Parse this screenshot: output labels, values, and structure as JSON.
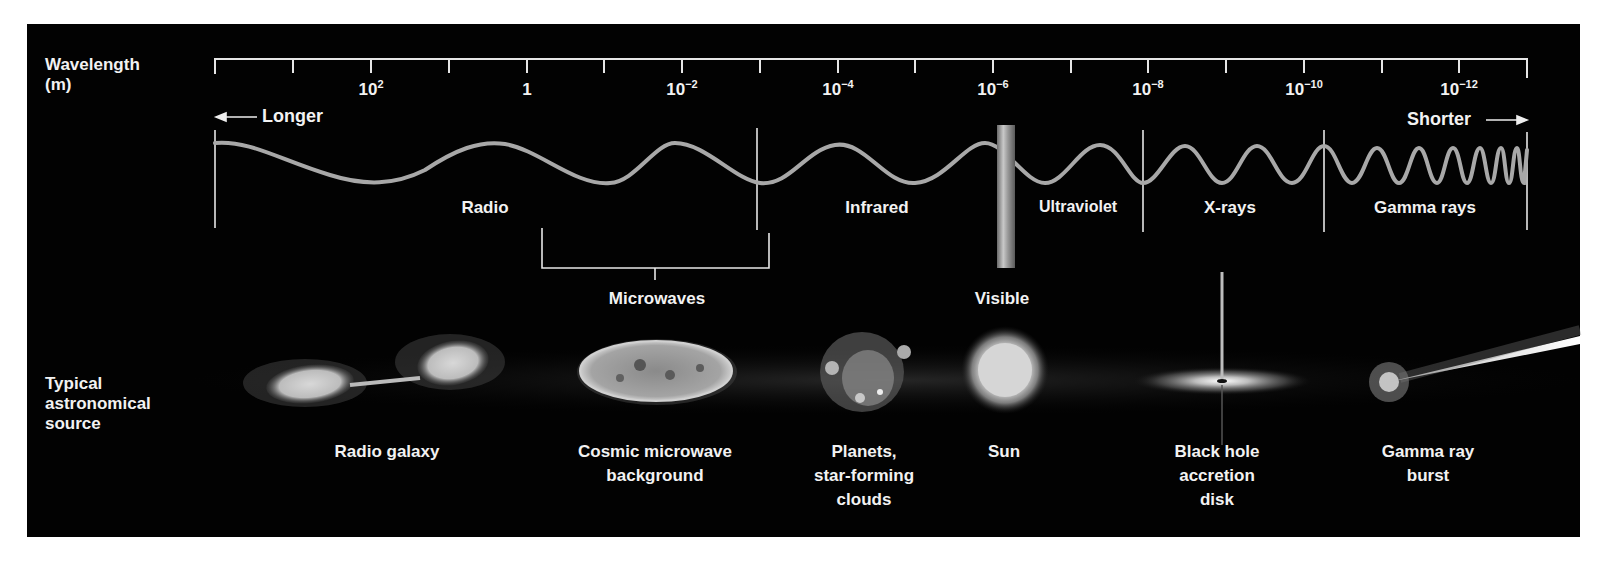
{
  "axis": {
    "title_line1": "Wavelength",
    "title_line2": "(m)",
    "ticks": [
      {
        "base": "10",
        "exp": "2",
        "x": 371
      },
      {
        "base": "1",
        "exp": "",
        "x": 527
      },
      {
        "base": "10",
        "exp": "−2",
        "x": 682
      },
      {
        "base": "10",
        "exp": "−4",
        "x": 838
      },
      {
        "base": "10",
        "exp": "−6",
        "x": 993
      },
      {
        "base": "10",
        "exp": "−8",
        "x": 1148
      },
      {
        "base": "10",
        "exp": "−10",
        "x": 1304
      },
      {
        "base": "10",
        "exp": "−12",
        "x": 1459
      }
    ],
    "longer_label": "Longer",
    "shorter_label": "Shorter",
    "arrow_left": "←",
    "arrow_right": "→"
  },
  "bands": [
    {
      "label": "Radio",
      "x": 485
    },
    {
      "label": "Infrared",
      "x": 877
    },
    {
      "label": "Ultraviolet",
      "x": 1078
    },
    {
      "label": "X-rays",
      "x": 1230
    },
    {
      "label": "Gamma rays",
      "x": 1425
    }
  ],
  "sub_bands": {
    "microwaves": "Microwaves",
    "visible": "Visible"
  },
  "sources": {
    "row_label_line1": "Typical",
    "row_label_line2": "astronomical",
    "row_label_line3": "source",
    "items": [
      {
        "lines": [
          "Radio galaxy"
        ],
        "x": 387,
        "icon": "radio-galaxy-icon"
      },
      {
        "lines": [
          "Cosmic microwave",
          "background"
        ],
        "x": 655,
        "icon": "cmb-icon"
      },
      {
        "lines": [
          "Planets,",
          "star-forming",
          "clouds"
        ],
        "x": 864,
        "icon": "nebula-icon"
      },
      {
        "lines": [
          "Sun"
        ],
        "x": 1004,
        "icon": "sun-icon"
      },
      {
        "lines": [
          "Black hole",
          "accretion",
          "disk"
        ],
        "x": 1217,
        "icon": "black-hole-icon"
      },
      {
        "lines": [
          "Gamma ray",
          "burst"
        ],
        "x": 1428,
        "icon": "gamma-ray-burst-icon"
      }
    ]
  },
  "colors": {
    "background": "#020202",
    "text": "#f2f2f2",
    "wave": "#a8a8a8",
    "ruler": "#e6e6e6"
  }
}
